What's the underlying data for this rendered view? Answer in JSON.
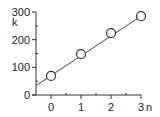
{
  "chart_data": {
    "type": "line",
    "title": "",
    "xlabel": "n",
    "ylabel": "k",
    "x": [
      0,
      1,
      2,
      3
    ],
    "series": [
      {
        "name": "k",
        "values": [
          69,
          148,
          224,
          285
        ],
        "marker": "open-circle",
        "line": "linear-fit"
      }
    ],
    "fit_line": {
      "x_start": -0.5,
      "y_start": 34,
      "x_end": 3,
      "y_end": 285
    },
    "xlim": [
      -0.5,
      3
    ],
    "ylim": [
      0,
      300
    ],
    "x_ticks": [
      0,
      1,
      2,
      3
    ],
    "x_tick_labels": [
      "0",
      "1",
      "2",
      "3"
    ],
    "y_ticks": [
      0,
      100,
      200,
      300
    ],
    "y_tick_labels": [
      "0",
      "100",
      "200",
      "300"
    ],
    "grid": false,
    "legend": false
  },
  "colors": {
    "axis": "#333333",
    "line": "#444444",
    "marker_fill": "#ffffff",
    "marker_stroke": "#333333"
  }
}
